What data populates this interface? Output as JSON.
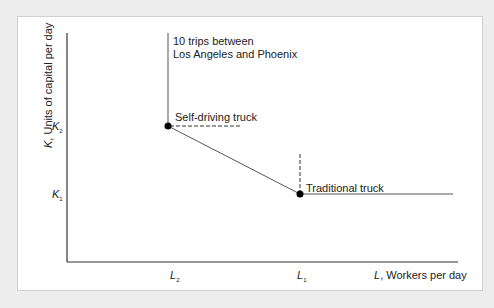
{
  "diagram": {
    "y_axis": {
      "var": "K",
      "label": ", Units of capital per day"
    },
    "x_axis": {
      "var": "L",
      "label": ", Workers per day"
    },
    "y_ticks": [
      {
        "var": "K",
        "sub": "2"
      },
      {
        "var": "K",
        "sub": "1"
      }
    ],
    "x_ticks": [
      {
        "var": "L",
        "sub": "2"
      },
      {
        "var": "L",
        "sub": "1"
      }
    ],
    "isoquant_label_line1": "10 trips between",
    "isoquant_label_line2": "Los Angeles and Phoenix",
    "points": [
      {
        "label": "Self-driving truck",
        "L": "L2",
        "K": "K2"
      },
      {
        "label": "Traditional truck",
        "L": "L1",
        "K": "K1"
      }
    ],
    "colors": {
      "line": "#555555",
      "axis": "#333333",
      "point": "#000000",
      "panel_bg": "#ffffff",
      "page_bg": "#ededed"
    }
  }
}
